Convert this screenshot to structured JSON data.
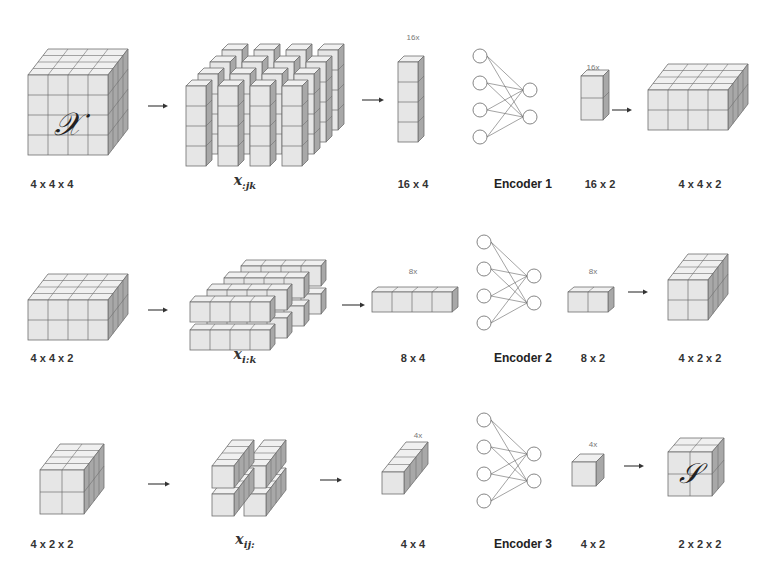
{
  "diagram": {
    "colors": {
      "face_front": "#e6e6e6",
      "face_top": "#f0f0f0",
      "face_side": "#a8a8a8",
      "edge": "#6e6e6e",
      "arrow": "#333333",
      "node": "#777777"
    },
    "rows": [
      {
        "id": "row1",
        "input_label": "4 x 4 x 4",
        "input_symbol": "𝒳",
        "slice_label_main": "x",
        "slice_label_sub": ":jk",
        "reshape_label": "16 x 4",
        "reshape_count": "16x",
        "encoder_label": "Encoder 1",
        "encoded_label": "16 x 2",
        "encoded_count": "16x",
        "output_label": "4 x 4 x 2"
      },
      {
        "id": "row2",
        "input_label": "4 x 4 x 2",
        "slice_label_main": "x",
        "slice_label_sub": "i:k",
        "reshape_label": "8 x 4",
        "reshape_count": "8x",
        "encoder_label": "Encoder 2",
        "encoded_label": "8 x 2",
        "encoded_count": "8x",
        "output_label": "4 x 2 x 2"
      },
      {
        "id": "row3",
        "input_label": "4 x 2 x 2",
        "slice_label_main": "x",
        "slice_label_sub": "ij:",
        "reshape_label": "4 x 4",
        "reshape_count": "4x",
        "encoder_label": "Encoder 3",
        "encoded_label": "4 x 2",
        "encoded_count": "4x",
        "output_label": "2 x 2 x 2",
        "output_symbol": "𝒮"
      }
    ]
  }
}
